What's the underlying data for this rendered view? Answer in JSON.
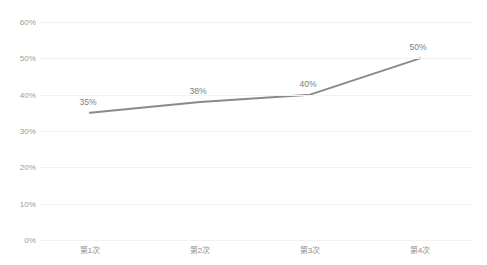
{
  "chart_data": {
    "type": "line",
    "title": "",
    "xlabel": "",
    "ylabel": "",
    "categories": [
      "第1次",
      "第2次",
      "第3次",
      "第4次"
    ],
    "values": [
      35,
      38,
      40,
      50
    ],
    "point_labels": [
      "35%",
      "38%",
      "40%",
      "50%"
    ],
    "ylim": [
      0,
      60
    ],
    "ytick_values": [
      60,
      50,
      40,
      30,
      20,
      10,
      0
    ],
    "ytick_labels": [
      "60%",
      "50%",
      "40%",
      "30%",
      "20%",
      "10%",
      "0%"
    ],
    "grid": "horizontal",
    "legend": "none",
    "series": [
      {
        "name": "",
        "values": [
          35,
          38,
          40,
          50
        ],
        "color": "#8a8a8a",
        "line_width": 2,
        "markers": false
      }
    ],
    "colors": {
      "line": "#8a8a8a",
      "gridline": "#f2f2f2",
      "axis_text": "#9a9a9a",
      "label_text": "#7d7d7d",
      "background": "#ffffff"
    }
  }
}
